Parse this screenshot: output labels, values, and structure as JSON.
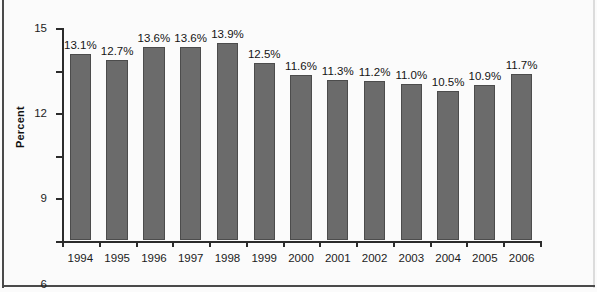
{
  "chart_data": {
    "type": "bar",
    "title": "",
    "xlabel": "",
    "ylabel": "Percent",
    "categories": [
      "1994",
      "1995",
      "1996",
      "1997",
      "1998",
      "1999",
      "2000",
      "2001",
      "2002",
      "2003",
      "2004",
      "2005",
      "2006"
    ],
    "values": [
      13.1,
      12.7,
      13.6,
      13.6,
      13.9,
      12.5,
      11.6,
      11.3,
      11.2,
      11.0,
      10.5,
      10.9,
      11.7
    ],
    "data_labels": [
      "13.1%",
      "12.7%",
      "13.6%",
      "13.6%",
      "13.9%",
      "12.5%",
      "11.6%",
      "11.3%",
      "11.2%",
      "11.0%",
      "10.5%",
      "10.9%",
      "11.7%"
    ],
    "ylim": [
      0,
      15
    ],
    "yticks": [
      0,
      3,
      6,
      9,
      12,
      15
    ],
    "ytick_labels": [
      "0",
      "3",
      "6",
      "9",
      "12",
      "15"
    ],
    "grid": false,
    "legend": false,
    "bar_color": "#6b6b6b",
    "bar_edge_color": "#4c4c4c",
    "axis_color": "#2b2b2b",
    "background_color": "#fbfbfb"
  }
}
